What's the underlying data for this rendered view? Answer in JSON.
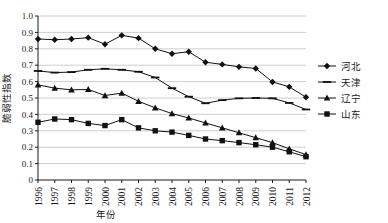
{
  "chart_data": {
    "type": "line",
    "title": "",
    "xlabel": "年份",
    "ylabel": "脆弱性指数",
    "ylim": [
      0,
      1.0
    ],
    "ytick_labels": [
      "0",
      "0.1",
      "0.2",
      "0.3",
      "0.4",
      "0.5",
      "0.6",
      "0.7",
      "0.8",
      "0.9",
      "1.0"
    ],
    "ytick_values": [
      0,
      0.1,
      0.2,
      0.3,
      0.4,
      0.5,
      0.6,
      0.7,
      0.8,
      0.9,
      1.0
    ],
    "grid": true,
    "legend_position": "right",
    "categories": [
      "1996",
      "1997",
      "1998",
      "1999",
      "2000",
      "2001",
      "2002",
      "2003",
      "2004",
      "2005",
      "2006",
      "2007",
      "2008",
      "2009",
      "2010",
      "2011",
      "2012"
    ],
    "series": [
      {
        "name": "河北",
        "marker": "diamond",
        "color": "#111111",
        "values": [
          0.86,
          0.855,
          0.86,
          0.868,
          0.828,
          0.882,
          0.865,
          0.8,
          0.77,
          0.782,
          0.718,
          0.705,
          0.69,
          0.68,
          0.598,
          0.568,
          0.505
        ]
      },
      {
        "name": "天津",
        "marker": "dash",
        "color": "#111111",
        "values": [
          0.665,
          0.655,
          0.658,
          0.672,
          0.678,
          0.672,
          0.66,
          0.625,
          0.56,
          0.508,
          0.468,
          0.487,
          0.498,
          0.5,
          0.498,
          0.47,
          0.43
        ]
      },
      {
        "name": "辽宁",
        "marker": "triangle",
        "color": "#111111",
        "values": [
          0.58,
          0.56,
          0.55,
          0.552,
          0.515,
          0.53,
          0.48,
          0.44,
          0.405,
          0.378,
          0.348,
          0.318,
          0.288,
          0.258,
          0.228,
          0.19,
          0.155
        ]
      },
      {
        "name": "山东",
        "marker": "square",
        "color": "#111111",
        "values": [
          0.352,
          0.372,
          0.368,
          0.345,
          0.332,
          0.368,
          0.318,
          0.3,
          0.292,
          0.272,
          0.25,
          0.24,
          0.228,
          0.215,
          0.2,
          0.172,
          0.142
        ]
      }
    ]
  },
  "legend": {
    "items": [
      {
        "label": "河北",
        "marker": "diamond"
      },
      {
        "label": "天津",
        "marker": "dash"
      },
      {
        "label": "辽宁",
        "marker": "triangle"
      },
      {
        "label": "山东",
        "marker": "square"
      }
    ]
  }
}
